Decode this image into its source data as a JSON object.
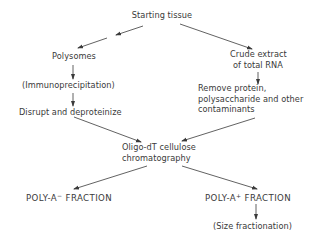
{
  "diagram": {
    "type": "flowchart",
    "nodes": {
      "start": {
        "lines": [
          "Starting tissue"
        ]
      },
      "polysomes": {
        "lines": [
          "Polysomes"
        ]
      },
      "immuno": {
        "lines": [
          "(Immunoprecipitation)"
        ]
      },
      "disrupt": {
        "lines": [
          "Disrupt and deproteinize"
        ]
      },
      "crude": {
        "lines": [
          "Crude extract",
          "of total RNA"
        ]
      },
      "remove": {
        "lines": [
          "Remove protein,",
          "polysaccharide and other",
          "contaminants"
        ]
      },
      "oligo": {
        "lines": [
          "Oligo-dT cellulose",
          "chromatography"
        ]
      },
      "polyA_minus": {
        "base": "POLY-A",
        "sup": "−",
        "rest": " FRACTION"
      },
      "polyA_plus": {
        "base": "POLY-A",
        "sup": "+",
        "rest": " FRACTION"
      },
      "size": {
        "lines": [
          "(Size fractionation)"
        ]
      }
    },
    "edges": [
      {
        "from": "start",
        "to": "polysomes",
        "note": "broken arrow with gap"
      },
      {
        "from": "start",
        "to": "crude"
      },
      {
        "from": "polysomes",
        "to": "immuno"
      },
      {
        "from": "immuno",
        "to": "disrupt"
      },
      {
        "from": "crude",
        "to": "remove"
      },
      {
        "from": "disrupt",
        "to": "oligo"
      },
      {
        "from": "remove",
        "to": "oligo"
      },
      {
        "from": "oligo",
        "to": "polyA_minus"
      },
      {
        "from": "oligo",
        "to": "polyA_plus"
      },
      {
        "from": "polyA_plus",
        "to": "size"
      }
    ],
    "colors": {
      "ink": "#3a3a3a",
      "background": "#ffffff"
    }
  }
}
